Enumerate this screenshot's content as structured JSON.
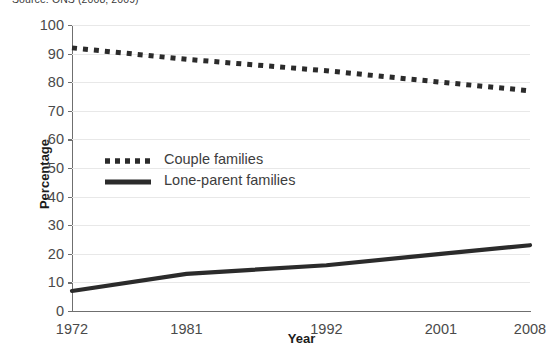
{
  "source_note": "Source: ONS (2008; 2009)",
  "chart_data": {
    "type": "line",
    "title": "",
    "xlabel": "Year",
    "ylabel": "Percentage",
    "categories": [
      "1972",
      "1981",
      "1992",
      "2001",
      "2008"
    ],
    "x": [
      1972,
      1981,
      1992,
      2001,
      2008
    ],
    "xlim": [
      1972,
      2008
    ],
    "ylim": [
      0,
      100
    ],
    "yticks": [
      0,
      10,
      20,
      30,
      40,
      50,
      60,
      70,
      80,
      90,
      100
    ],
    "ytick_labels": [
      "0",
      "10",
      "20",
      "30",
      "40",
      "50",
      "60",
      "70",
      "80",
      "90",
      "100"
    ],
    "grid": true,
    "legend_position": "center-left-inside",
    "series": [
      {
        "name": "Couple families",
        "style": "dotted",
        "color": "#2b2b2b",
        "values": [
          92,
          88,
          84,
          80,
          77
        ]
      },
      {
        "name": "Lone-parent families",
        "style": "solid",
        "color": "#2b2b2b",
        "values": [
          7,
          13,
          16,
          20,
          23
        ]
      }
    ]
  },
  "colors": {
    "axis": "#6f6f6f",
    "grid": "#e8e8e8",
    "text": "#4a4a4a",
    "series": "#2b2b2b"
  }
}
